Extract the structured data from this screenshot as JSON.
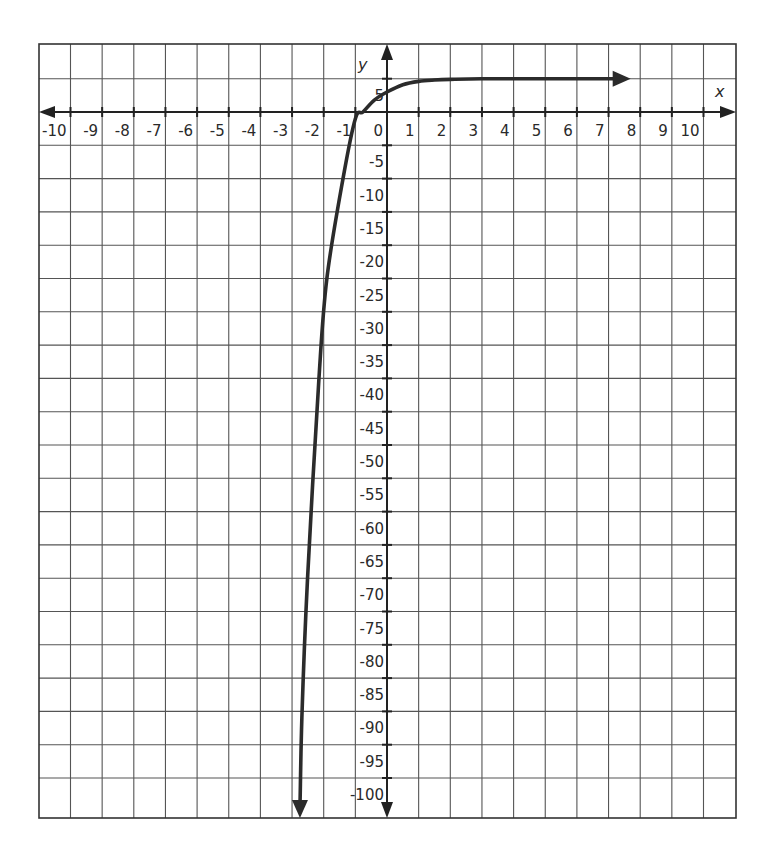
{
  "chart_data": {
    "type": "line",
    "title": "",
    "xlabel": "x",
    "ylabel": "y",
    "xlim": [
      -11,
      11
    ],
    "ylim": [
      -106,
      10
    ],
    "grid": true,
    "legend": null,
    "x_ticks": [
      -10,
      -9,
      -8,
      -7,
      -6,
      -5,
      -4,
      -3,
      -2,
      -1,
      0,
      1,
      2,
      3,
      4,
      5,
      6,
      7,
      8,
      9,
      10
    ],
    "x_tick_labels": [
      "-10",
      "-9",
      "-8",
      "-7",
      "-6",
      "-5",
      "-4",
      "-3",
      "-2",
      "-1",
      "0",
      "1",
      "2",
      "3",
      "4",
      "5",
      "6",
      "7",
      "8",
      "9",
      "10"
    ],
    "y_ticks": [
      5,
      -5,
      -10,
      -15,
      -20,
      -25,
      -30,
      -35,
      -40,
      -45,
      -50,
      -55,
      -60,
      -65,
      -70,
      -75,
      -80,
      -85,
      -90,
      -95,
      -100
    ],
    "y_tick_labels": [
      "5",
      "-5",
      "-10",
      "-15",
      "-20",
      "-25",
      "-30",
      "-35",
      "-40",
      "-45",
      "-50",
      "-55",
      "-60",
      "-65",
      "-70",
      "-75",
      "-80",
      "-85",
      "-90",
      "-95",
      "-100"
    ],
    "series": [
      {
        "name": "curve",
        "description": "Exponential curve with horizontal asymptote y = 5, arrow toward +x and arrow toward -y",
        "color": "#2b2b2b",
        "asymptote_y": 5,
        "y_intercept": 3,
        "x_intercept": -0.76,
        "x": [
          -2.75,
          -2.69,
          -2.51,
          -2.15,
          -1.9,
          -1.39,
          -1.0,
          -0.76,
          -0.4,
          0,
          0.5,
          1,
          1.5,
          2,
          3,
          5,
          7.7
        ],
        "y": [
          -106,
          -91,
          -70,
          -40,
          -25,
          -10,
          -1,
          0,
          1.8,
          3,
          4.1,
          4.6,
          4.8,
          4.9,
          5,
          5,
          5
        ]
      }
    ]
  },
  "colors": {
    "grid": "#555555",
    "axis": "#222222",
    "curve": "#2b2b2b",
    "background": "#ffffff"
  }
}
